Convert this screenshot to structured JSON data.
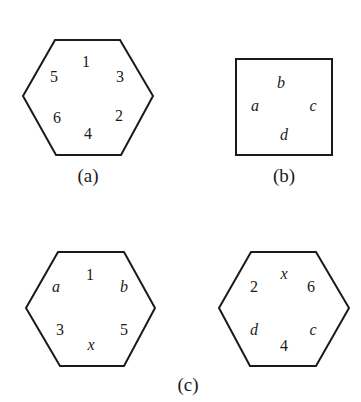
{
  "figures": {
    "a": {
      "caption": "(a)",
      "shape": "hexagon",
      "labels": {
        "top": "1",
        "upper_left": "5",
        "upper_right": "3",
        "lower_left": "6",
        "lower_right": "2",
        "bottom": "4"
      }
    },
    "b": {
      "caption": "(b)",
      "shape": "square",
      "labels": {
        "top": "b",
        "left": "a",
        "right": "c",
        "bottom": "d"
      }
    },
    "c": {
      "caption": "(c)",
      "left_hexagon": {
        "labels": {
          "top": "1",
          "upper_left": "a",
          "upper_right": "b",
          "lower_left": "3",
          "lower_right": "5",
          "bottom": "x"
        }
      },
      "right_hexagon": {
        "labels": {
          "top": "x",
          "upper_left": "2",
          "upper_right": "6",
          "lower_left": "d",
          "lower_right": "c",
          "bottom": "4"
        }
      }
    }
  }
}
